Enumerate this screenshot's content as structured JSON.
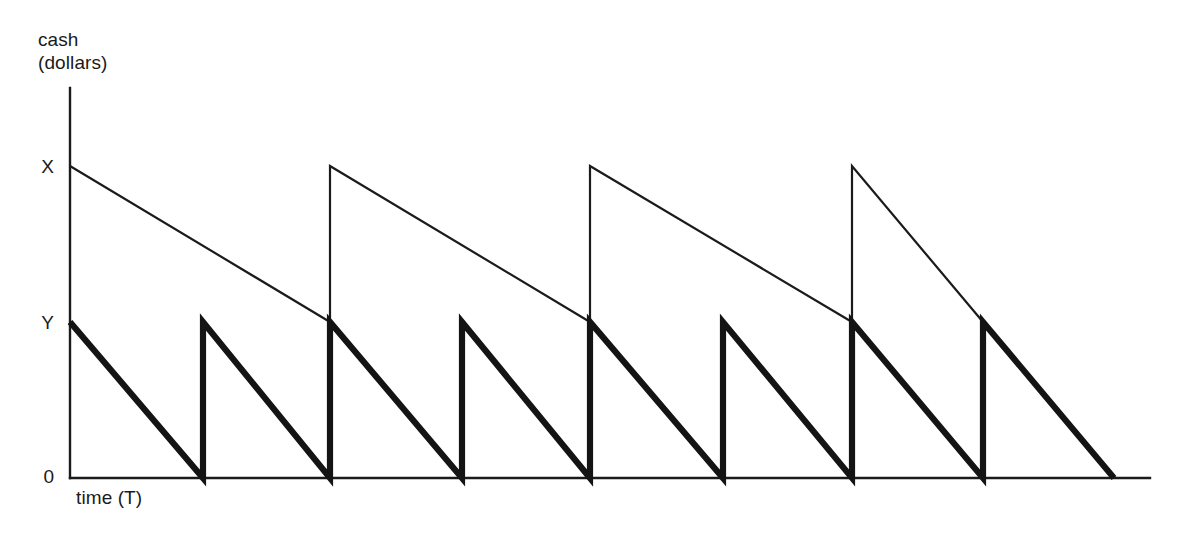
{
  "figure": {
    "background_color": "#ffffff",
    "ink_color": "#1a1a1a",
    "width": 1178,
    "height": 537
  },
  "axes": {
    "y_axis_title_line_1": "cash",
    "y_axis_title_line_2": "(dollars)",
    "x_axis_title": "time (T)",
    "tick_labels": {
      "upper": "X",
      "middle": "Y",
      "lower": "0"
    }
  },
  "chart_data": {
    "type": "line",
    "title": "",
    "subtitle": "",
    "xlabel": "time (T)",
    "ylabel": "cash (dollars)",
    "xlim": [
      0,
      1
    ],
    "ylim": [
      0,
      1
    ],
    "grid": false,
    "legend_position": "none",
    "y_tick_labels": [
      "0",
      "Y",
      "X"
    ],
    "y_tick_values": [
      0,
      0.5,
      1
    ],
    "x_tick_labels": [],
    "annotations": [],
    "series": [
      {
        "name": "large-withdrawal-path",
        "style": "thin",
        "line_width_px": 2.2,
        "peak_label": "X",
        "trough_label": "Y",
        "cycles": 4,
        "points": [
          [
            70,
            1.0
          ],
          [
            330,
            0.5
          ],
          [
            330,
            1.0
          ],
          [
            590,
            0.5
          ],
          [
            590,
            1.0
          ],
          [
            852,
            0.5
          ],
          [
            852,
            1.0
          ],
          [
            983,
            0.5
          ]
        ]
      },
      {
        "name": "small-withdrawal-path",
        "style": "thick",
        "line_width_px": 6.2,
        "peak_label": "Y",
        "trough_label": "0",
        "cycles": 8,
        "points": [
          [
            70,
            0.5
          ],
          [
            203,
            0.0
          ],
          [
            203,
            0.5
          ],
          [
            330,
            0.0
          ],
          [
            330,
            0.5
          ],
          [
            462,
            0.0
          ],
          [
            462,
            0.5
          ],
          [
            590,
            0.0
          ],
          [
            590,
            0.5
          ],
          [
            723,
            0.0
          ],
          [
            723,
            0.5
          ],
          [
            852,
            0.0
          ],
          [
            852,
            0.5
          ],
          [
            983,
            0.0
          ],
          [
            983,
            0.5
          ],
          [
            1114,
            0.0
          ]
        ]
      }
    ],
    "geometry": {
      "y_axis_x": 70,
      "y_axis_top": 88,
      "baseline_y": 478,
      "baseline_right": 1150,
      "level_x_y": 166,
      "level_y_y": 322,
      "level_zero_y": 478,
      "thin_peak_xs": [
        70,
        330,
        590,
        852
      ],
      "thick_peak_xs": [
        70,
        203,
        330,
        462,
        590,
        723,
        852,
        983
      ],
      "thick_zero_xs": [
        203,
        330,
        462,
        590,
        723,
        852,
        983,
        1114
      ]
    }
  }
}
